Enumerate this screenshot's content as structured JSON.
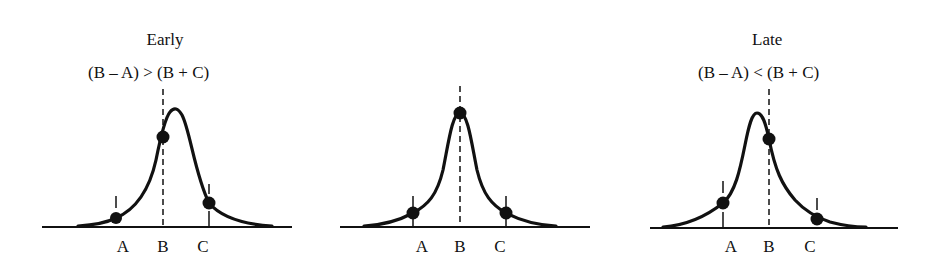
{
  "figure": {
    "panels": [
      {
        "id": "early",
        "title": "Early",
        "relation": "(B – A) > (B + C)",
        "labels": [
          "A",
          "B",
          "C"
        ],
        "description": "Peak shifted right of B; B falls on rising edge"
      },
      {
        "id": "centered",
        "title": "",
        "relation": "",
        "labels": [
          "A",
          "B",
          "C"
        ],
        "description": "Peak centered at B; A and C symmetric"
      },
      {
        "id": "late",
        "title": "Late",
        "relation": "(B – A) < (B + C)",
        "labels": [
          "A",
          "B",
          "C"
        ],
        "description": "Peak shifted left of B; B falls on falling edge"
      }
    ],
    "colors": {
      "line": "#111111",
      "background": "#ffffff"
    }
  }
}
